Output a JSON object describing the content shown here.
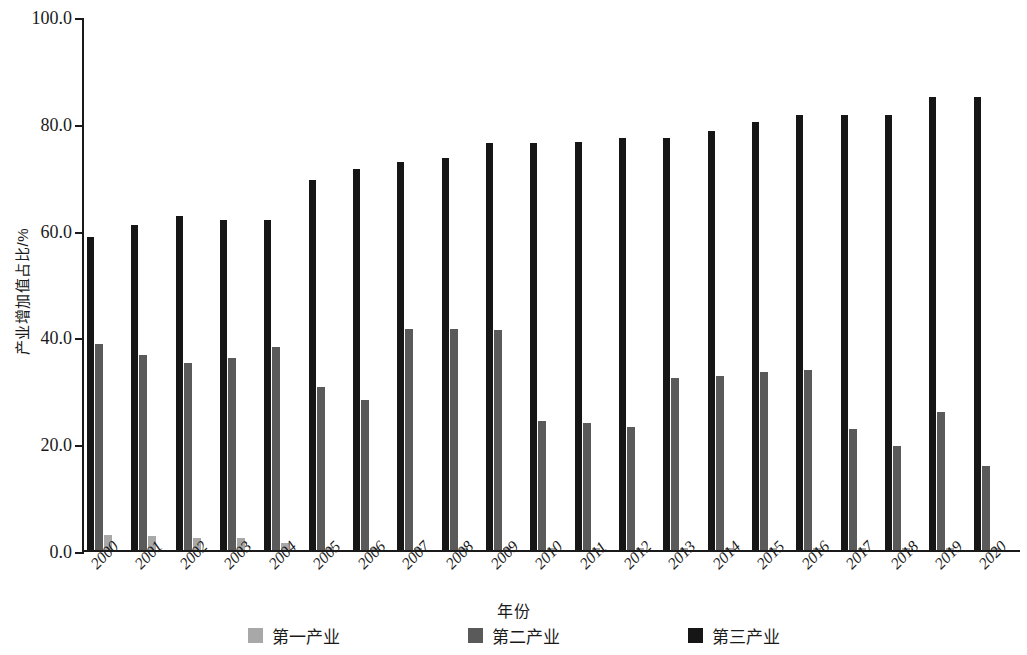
{
  "chart_data": {
    "type": "bar",
    "title": "",
    "xlabel": "年份",
    "ylabel": "产业增加值占比/%",
    "ylim": [
      0,
      100
    ],
    "yticks": [
      "0.0",
      "20.0",
      "40.0",
      "60.0",
      "80.0",
      "100.0"
    ],
    "ytick_values": [
      0,
      20,
      40,
      60,
      80,
      100
    ],
    "grid": false,
    "legend_position": "bottom",
    "categories": [
      "2000",
      "2001",
      "2002",
      "2003",
      "2004",
      "2005",
      "2006",
      "2007",
      "2008",
      "2009",
      "2010",
      "2011",
      "2012",
      "2013",
      "2014",
      "2015",
      "2016",
      "2017",
      "2018",
      "2019",
      "2020"
    ],
    "series": [
      {
        "name": "第一产业",
        "color": "#a8a8a8",
        "values": [
          2.9,
          2.6,
          2.3,
          2.2,
          1.4,
          0.5,
          0.4,
          0.4,
          0.4,
          0.4,
          0.4,
          0.4,
          0.4,
          0.4,
          0.3,
          0.3,
          0.3,
          0.3,
          0.3,
          0.3,
          0.3
        ]
      },
      {
        "name": "第二产业",
        "color": "#5a5a5a",
        "values": [
          38.5,
          36.6,
          35.1,
          36.0,
          38.0,
          30.6,
          28.1,
          41.3,
          41.3,
          41.2,
          24.2,
          23.8,
          23.0,
          32.2,
          32.6,
          33.4,
          33.7,
          22.6,
          19.4,
          25.8,
          15.7
        ]
      },
      {
        "name": "第三产业",
        "color": "#161616",
        "values": [
          58.6,
          60.8,
          62.5,
          61.8,
          61.8,
          69.2,
          71.3,
          72.7,
          73.5,
          76.2,
          76.3,
          76.4,
          77.1,
          77.2,
          78.5,
          80.2,
          81.4,
          81.5,
          81.5,
          84.8,
          84.9
        ]
      }
    ]
  },
  "axes": {
    "y_title": "产业增加值占比/%",
    "x_title": "年份",
    "y_tick_labels": [
      "100.0",
      "80.0",
      "60.0",
      "40.0",
      "20.0",
      "0.0"
    ]
  },
  "legend": {
    "items": [
      {
        "label": "第一产业",
        "color": "#a8a8a8"
      },
      {
        "label": "第二产业",
        "color": "#5a5a5a"
      },
      {
        "label": "第三产业",
        "color": "#161616"
      }
    ]
  }
}
